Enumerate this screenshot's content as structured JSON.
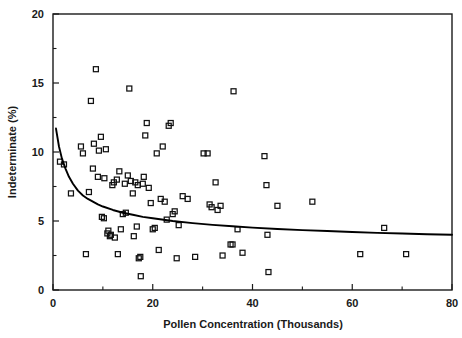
{
  "chart_data": {
    "type": "scatter",
    "title": "",
    "xlabel": "Pollen Concentration (Thousands)",
    "ylabel": "Indeterminate (%)",
    "xlim": [
      0,
      80
    ],
    "ylim": [
      0,
      20
    ],
    "xticks": [
      0,
      20,
      40,
      60,
      80
    ],
    "xtick_labels": [
      "0",
      "20",
      "40",
      "60",
      "80"
    ],
    "yticks": [
      0,
      5,
      10,
      15,
      20
    ],
    "ytick_labels": [
      "0",
      "5",
      "10",
      "15",
      "20"
    ],
    "x_minor_ticks": [
      10,
      30,
      50,
      70
    ],
    "y_minor_ticks": [
      2.5,
      7.5,
      12.5,
      17.5
    ],
    "grid": false,
    "legend": null,
    "marker": "open-square",
    "marker_size": 5,
    "series": [
      {
        "name": "Samples",
        "points": [
          [
            1.4,
            9.3
          ],
          [
            2.2,
            9.1
          ],
          [
            3.6,
            7.0
          ],
          [
            5.6,
            10.4
          ],
          [
            6.0,
            9.9
          ],
          [
            6.6,
            2.6
          ],
          [
            7.2,
            7.1
          ],
          [
            7.6,
            13.7
          ],
          [
            8.0,
            8.8
          ],
          [
            8.2,
            10.6
          ],
          [
            8.6,
            16.0
          ],
          [
            9.0,
            8.2
          ],
          [
            9.2,
            10.1
          ],
          [
            9.6,
            11.1
          ],
          [
            9.8,
            5.3
          ],
          [
            10.2,
            5.2
          ],
          [
            10.3,
            8.1
          ],
          [
            10.6,
            10.2
          ],
          [
            10.9,
            4.1
          ],
          [
            11.1,
            4.3
          ],
          [
            11.4,
            3.9
          ],
          [
            11.6,
            4.0
          ],
          [
            11.9,
            7.6
          ],
          [
            12.2,
            7.8
          ],
          [
            12.4,
            3.8
          ],
          [
            12.8,
            8.0
          ],
          [
            13.0,
            2.6
          ],
          [
            13.3,
            8.6
          ],
          [
            13.6,
            4.4
          ],
          [
            14.0,
            5.5
          ],
          [
            14.4,
            7.7
          ],
          [
            14.6,
            5.6
          ],
          [
            15.0,
            8.3
          ],
          [
            15.3,
            14.6
          ],
          [
            15.6,
            7.9
          ],
          [
            16.0,
            7.0
          ],
          [
            16.2,
            3.9
          ],
          [
            16.5,
            7.8
          ],
          [
            16.8,
            4.6
          ],
          [
            17.0,
            7.6
          ],
          [
            17.2,
            2.3
          ],
          [
            17.5,
            2.4
          ],
          [
            17.6,
            1.0
          ],
          [
            18.0,
            7.7
          ],
          [
            18.2,
            8.2
          ],
          [
            18.5,
            11.2
          ],
          [
            18.8,
            12.1
          ],
          [
            19.2,
            7.4
          ],
          [
            19.6,
            6.3
          ],
          [
            20.0,
            4.4
          ],
          [
            20.4,
            4.5
          ],
          [
            20.8,
            9.9
          ],
          [
            21.2,
            2.9
          ],
          [
            21.6,
            6.6
          ],
          [
            22.0,
            10.4
          ],
          [
            22.4,
            6.4
          ],
          [
            22.8,
            5.1
          ],
          [
            23.2,
            11.9
          ],
          [
            23.6,
            12.1
          ],
          [
            24.0,
            5.5
          ],
          [
            24.4,
            5.7
          ],
          [
            24.8,
            2.3
          ],
          [
            25.2,
            4.7
          ],
          [
            26.0,
            6.8
          ],
          [
            27.0,
            6.6
          ],
          [
            28.5,
            2.4
          ],
          [
            30.2,
            9.9
          ],
          [
            31.0,
            9.9
          ],
          [
            31.4,
            6.2
          ],
          [
            31.8,
            6.0
          ],
          [
            32.6,
            7.8
          ],
          [
            33.0,
            5.8
          ],
          [
            33.6,
            6.1
          ],
          [
            34.0,
            2.5
          ],
          [
            35.6,
            3.3
          ],
          [
            36.0,
            3.3
          ],
          [
            36.2,
            14.4
          ],
          [
            37.0,
            4.4
          ],
          [
            38.0,
            2.7
          ],
          [
            42.4,
            9.7
          ],
          [
            42.8,
            7.6
          ],
          [
            43.0,
            4.0
          ],
          [
            43.2,
            1.3
          ],
          [
            45.0,
            6.1
          ],
          [
            52.0,
            6.4
          ],
          [
            61.6,
            2.6
          ],
          [
            66.4,
            4.5
          ],
          [
            70.8,
            2.6
          ]
        ]
      }
    ],
    "fit_curve": {
      "name": "fitted regression curve",
      "style": "solid",
      "points": [
        [
          0.6,
          11.7
        ],
        [
          1.2,
          10.4
        ],
        [
          1.8,
          9.5
        ],
        [
          2.5,
          8.8
        ],
        [
          3.2,
          8.2
        ],
        [
          4.0,
          7.7
        ],
        [
          5.0,
          7.2
        ],
        [
          6.0,
          6.85
        ],
        [
          7.0,
          6.6
        ],
        [
          8.0,
          6.4
        ],
        [
          9.0,
          6.2
        ],
        [
          10.0,
          6.05
        ],
        [
          12.0,
          5.8
        ],
        [
          14.0,
          5.6
        ],
        [
          16.0,
          5.45
        ],
        [
          18.0,
          5.3
        ],
        [
          20.0,
          5.2
        ],
        [
          24.0,
          5.0
        ],
        [
          28.0,
          4.85
        ],
        [
          32.0,
          4.72
        ],
        [
          36.0,
          4.62
        ],
        [
          40.0,
          4.52
        ],
        [
          45.0,
          4.42
        ],
        [
          50.0,
          4.34
        ],
        [
          55.0,
          4.27
        ],
        [
          60.0,
          4.2
        ],
        [
          65.0,
          4.14
        ],
        [
          70.0,
          4.09
        ],
        [
          75.0,
          4.04
        ],
        [
          80.0,
          4.0
        ]
      ]
    }
  }
}
